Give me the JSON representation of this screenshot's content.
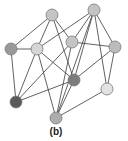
{
  "figure": {
    "caption": "(b)",
    "type": "undirected-graph",
    "nodes": [
      {
        "id": "A",
        "x": 52,
        "y": 15,
        "r": 6,
        "fill": "#c4c4c4"
      },
      {
        "id": "B",
        "x": 94,
        "y": 10,
        "r": 6,
        "fill": "#c4c4c4"
      },
      {
        "id": "C",
        "x": 11,
        "y": 49,
        "r": 6,
        "fill": "#9a9a9a"
      },
      {
        "id": "D",
        "x": 37,
        "y": 49,
        "r": 6,
        "fill": "#d6d6d6"
      },
      {
        "id": "E",
        "x": 72,
        "y": 42,
        "r": 6,
        "fill": "#c4c4c4"
      },
      {
        "id": "F",
        "x": 115,
        "y": 47,
        "r": 6,
        "fill": "#bcbcbc"
      },
      {
        "id": "G",
        "x": 74,
        "y": 80,
        "r": 6,
        "fill": "#7c7c7c"
      },
      {
        "id": "H",
        "x": 107,
        "y": 89,
        "r": 6,
        "fill": "#e2e2e2"
      },
      {
        "id": "J",
        "x": 16,
        "y": 102,
        "r": 6,
        "fill": "#5a5a5a"
      },
      {
        "id": "I",
        "x": 56,
        "y": 118,
        "r": 6,
        "fill": "#adadad"
      }
    ],
    "edges": [
      [
        "A",
        "C"
      ],
      [
        "A",
        "D"
      ],
      [
        "A",
        "E"
      ],
      [
        "A",
        "G"
      ],
      [
        "B",
        "D"
      ],
      [
        "B",
        "E"
      ],
      [
        "B",
        "F"
      ],
      [
        "B",
        "G"
      ],
      [
        "B",
        "H"
      ],
      [
        "B",
        "I"
      ],
      [
        "C",
        "D"
      ],
      [
        "C",
        "J"
      ],
      [
        "D",
        "G"
      ],
      [
        "D",
        "I"
      ],
      [
        "D",
        "J"
      ],
      [
        "E",
        "F"
      ],
      [
        "E",
        "J"
      ],
      [
        "E",
        "I"
      ],
      [
        "F",
        "G"
      ],
      [
        "F",
        "H"
      ],
      [
        "G",
        "J"
      ],
      [
        "G",
        "I"
      ],
      [
        "H",
        "I"
      ]
    ]
  }
}
